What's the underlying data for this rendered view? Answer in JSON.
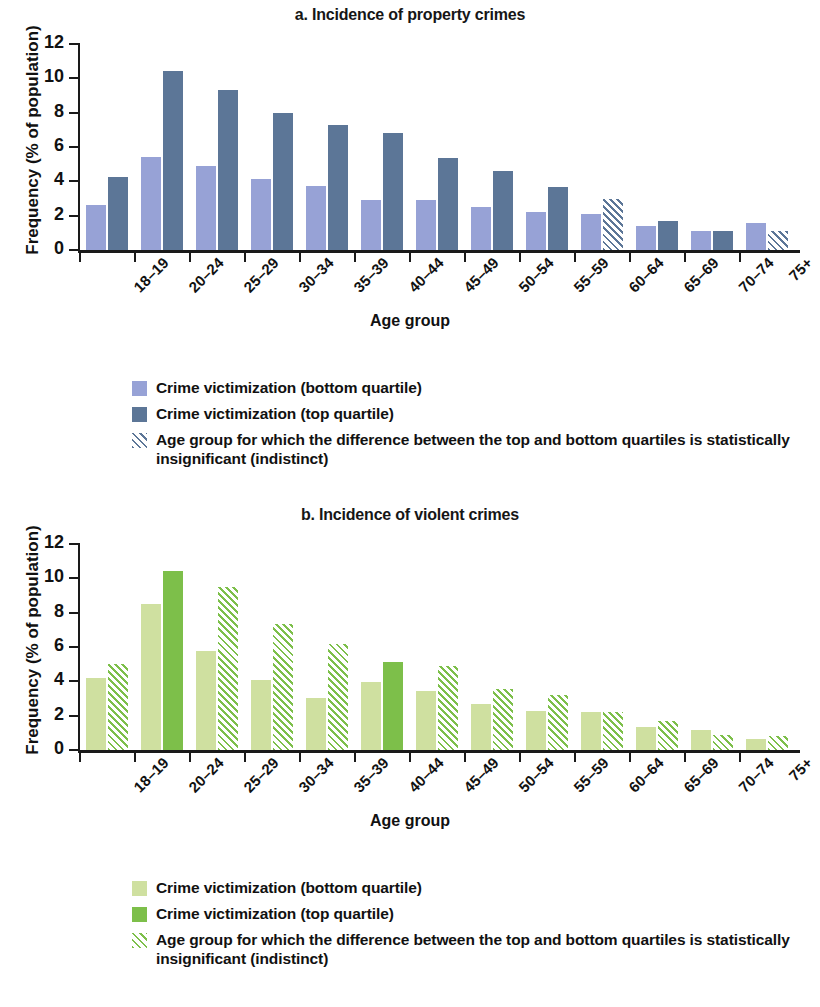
{
  "figure": {
    "xlabel": "Age group",
    "ylabel": "Frequency (% of population)",
    "yticks": [
      "0",
      "2",
      "4",
      "6",
      "8",
      "10",
      "12"
    ]
  },
  "panel_a": {
    "title": "a. Incidence of property crimes",
    "legend": [
      {
        "label": "Crime victimization (bottom quartile)",
        "swatch": "solid-light-blue"
      },
      {
        "label": "Crime victimization (top quartile)",
        "swatch": "solid-dark-blue"
      },
      {
        "label": "Age group for which the difference between the top and bottom quartiles is statistically insignificant (indistinct)",
        "swatch": "hatched-dark-blue"
      }
    ]
  },
  "panel_b": {
    "title": "b. Incidence of violent crimes",
    "legend": [
      {
        "label": "Crime victimization (bottom quartile)",
        "swatch": "solid-light-green"
      },
      {
        "label": "Crime victimization (top quartile)",
        "swatch": "solid-green"
      },
      {
        "label": "Age group for which the difference between the top and bottom quartiles is statistically insignificant (indistinct)",
        "swatch": "hatched-green"
      }
    ]
  },
  "colors": {
    "light_blue": "#97a2d6",
    "dark_blue": "#5c7697",
    "light_green": "#cfe0a0",
    "green": "#7dbf4a",
    "axis": "#1a1a1a"
  },
  "chart_data": [
    {
      "type": "bar",
      "title": "a. Incidence of property crimes",
      "xlabel": "Age group",
      "ylabel": "Frequency (% of population)",
      "ylim": [
        0,
        12
      ],
      "yticks": [
        0,
        2,
        4,
        6,
        8,
        10,
        12
      ],
      "grid": false,
      "legend_position": "below",
      "categories": [
        "18–19",
        "20–24",
        "25–29",
        "30–34",
        "35–39",
        "40–44",
        "45–49",
        "50–54",
        "55–59",
        "60–64",
        "65–69",
        "70–74",
        "75+"
      ],
      "series": [
        {
          "name": "Crime victimization (bottom quartile)",
          "color": "#97a2d6",
          "values": [
            2.6,
            5.4,
            4.9,
            4.15,
            3.75,
            2.9,
            2.9,
            2.5,
            2.2,
            2.1,
            1.4,
            1.1,
            1.6
          ],
          "hatched": [
            false,
            false,
            false,
            false,
            false,
            false,
            false,
            false,
            false,
            false,
            false,
            false,
            false
          ]
        },
        {
          "name": "Crime victimization (top quartile)",
          "color": "#5c7697",
          "values": [
            4.25,
            10.4,
            9.35,
            8.0,
            7.3,
            6.8,
            5.35,
            4.6,
            3.65,
            3.0,
            1.7,
            1.1,
            1.1
          ],
          "hatched": [
            false,
            false,
            false,
            false,
            false,
            false,
            false,
            false,
            false,
            true,
            false,
            false,
            true
          ]
        }
      ],
      "indistinct_groups": [
        "60–64",
        "75+"
      ]
    },
    {
      "type": "bar",
      "title": "b. Incidence of violent crimes",
      "xlabel": "Age group",
      "ylabel": "Frequency (% of population)",
      "ylim": [
        0,
        12
      ],
      "yticks": [
        0,
        2,
        4,
        6,
        8,
        10,
        12
      ],
      "grid": false,
      "legend_position": "below",
      "categories": [
        "18–19",
        "20–24",
        "25–29",
        "30–34",
        "35–39",
        "40–44",
        "45–49",
        "50–54",
        "55–59",
        "60–64",
        "65–69",
        "70–74",
        "75+"
      ],
      "series": [
        {
          "name": "Crime victimization (bottom quartile)",
          "color": "#cfe0a0",
          "values": [
            4.2,
            8.5,
            5.75,
            4.1,
            3.05,
            3.95,
            3.45,
            2.7,
            2.25,
            2.2,
            1.35,
            1.15,
            0.65
          ],
          "hatched": [
            false,
            false,
            false,
            false,
            false,
            false,
            false,
            false,
            false,
            false,
            false,
            false,
            false
          ]
        },
        {
          "name": "Crime victimization (top quartile)",
          "color": "#7dbf4a",
          "values": [
            5.0,
            10.45,
            9.5,
            7.35,
            6.15,
            5.1,
            4.9,
            3.55,
            3.2,
            2.2,
            1.7,
            0.9,
            0.8
          ],
          "hatched": [
            true,
            false,
            true,
            true,
            true,
            false,
            true,
            true,
            true,
            true,
            true,
            true,
            true
          ]
        }
      ],
      "indistinct_groups": [
        "18–19",
        "25–29",
        "30–34",
        "35–39",
        "45–49",
        "50–54",
        "55–59",
        "60–64",
        "65–69",
        "70–74",
        "75+"
      ]
    }
  ]
}
